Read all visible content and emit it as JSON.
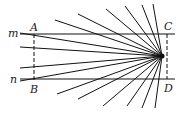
{
  "figure": {
    "labels": {
      "m": "m",
      "n": "n",
      "A": "A",
      "B": "B",
      "C": "C",
      "D": "D"
    },
    "focal_point": [
      162,
      56
    ],
    "line_m_y": 34,
    "line_n_y": 79,
    "ray_endpoints": [
      [
        55,
        20
      ],
      [
        78,
        14
      ],
      [
        106,
        9
      ],
      [
        125,
        6
      ],
      [
        142,
        5
      ],
      [
        153,
        4
      ],
      [
        20,
        33
      ],
      [
        20,
        47
      ],
      [
        20,
        68
      ],
      [
        20,
        81
      ],
      [
        57,
        94
      ],
      [
        78,
        99
      ],
      [
        103,
        106
      ],
      [
        127,
        106
      ],
      [
        142,
        108
      ],
      [
        155,
        108
      ]
    ],
    "colors": {
      "stroke": "#111111",
      "background": "#ffffff"
    }
  }
}
